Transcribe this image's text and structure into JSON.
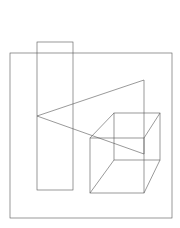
{
  "diagram": {
    "type": "line-drawing",
    "stroke_color": "#555555",
    "background": "#ffffff",
    "shapes": {
      "outer_square": {
        "x1": 10,
        "y1": 53,
        "x2": 172,
        "y2": 218
      },
      "tall_rectangle": {
        "x1": 37,
        "y1": 42,
        "x2": 73,
        "y2": 190
      },
      "triangle": {
        "points": [
          [
            37,
            116
          ],
          [
            144,
            80
          ],
          [
            144,
            154
          ]
        ]
      },
      "cube": {
        "front_face": {
          "x1": 90,
          "y1": 138,
          "x2": 144,
          "y2": 193
        },
        "back_face": {
          "x1": 114,
          "y1": 113,
          "x2": 160,
          "y2": 160
        }
      }
    }
  }
}
